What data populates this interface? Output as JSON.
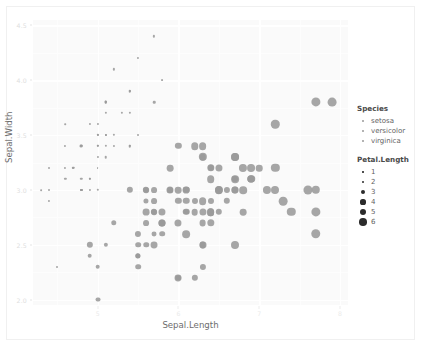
{
  "chart_data": {
    "type": "scatter",
    "title": "",
    "xlabel": "Sepal.Length",
    "ylabel": "Sepal.Width",
    "xlim": [
      4.2,
      8.1
    ],
    "ylim": [
      1.95,
      4.55
    ],
    "xticks": [
      5,
      6,
      7,
      8
    ],
    "yticks": [
      2.0,
      2.5,
      3.0,
      3.5,
      4.0,
      4.5
    ],
    "xtick_labels": [
      "5",
      "6",
      "7",
      "8"
    ],
    "ytick_labels": [
      "2.0",
      "2.5",
      "3.0",
      "3.5",
      "4.0",
      "4.5"
    ],
    "grid": true,
    "legend_position": "right",
    "size_variable": "Petal.Length",
    "color_variable": "Species",
    "point_color": "#9a9a9a",
    "panel_background": "#fafafa",
    "grid_color": "#ffffff",
    "series": [
      {
        "name": "setosa",
        "points": [
          [
            5.1,
            3.5,
            1.4
          ],
          [
            4.9,
            3.0,
            1.4
          ],
          [
            4.7,
            3.2,
            1.3
          ],
          [
            4.6,
            3.1,
            1.5
          ],
          [
            5.0,
            3.6,
            1.4
          ],
          [
            5.4,
            3.9,
            1.7
          ],
          [
            4.6,
            3.4,
            1.4
          ],
          [
            5.0,
            3.4,
            1.5
          ],
          [
            4.4,
            2.9,
            1.4
          ],
          [
            4.9,
            3.1,
            1.5
          ],
          [
            5.4,
            3.7,
            1.5
          ],
          [
            4.8,
            3.4,
            1.6
          ],
          [
            4.8,
            3.0,
            1.4
          ],
          [
            4.3,
            3.0,
            1.1
          ],
          [
            5.8,
            4.0,
            1.2
          ],
          [
            5.7,
            4.4,
            1.5
          ],
          [
            5.4,
            3.9,
            1.3
          ],
          [
            5.1,
            3.5,
            1.4
          ],
          [
            5.7,
            3.8,
            1.7
          ],
          [
            5.1,
            3.8,
            1.5
          ],
          [
            5.4,
            3.4,
            1.7
          ],
          [
            5.1,
            3.7,
            1.5
          ],
          [
            4.6,
            3.6,
            1.0
          ],
          [
            5.1,
            3.3,
            1.7
          ],
          [
            4.8,
            3.4,
            1.9
          ],
          [
            5.0,
            3.0,
            1.6
          ],
          [
            5.0,
            3.4,
            1.6
          ],
          [
            5.2,
            3.5,
            1.5
          ],
          [
            5.2,
            3.4,
            1.4
          ],
          [
            4.7,
            3.2,
            1.6
          ],
          [
            4.8,
            3.1,
            1.6
          ],
          [
            5.4,
            3.4,
            1.5
          ],
          [
            5.2,
            4.1,
            1.5
          ],
          [
            5.5,
            4.2,
            1.4
          ],
          [
            4.9,
            3.1,
            1.5
          ],
          [
            5.0,
            3.2,
            1.2
          ],
          [
            5.5,
            3.5,
            1.3
          ],
          [
            4.9,
            3.6,
            1.4
          ],
          [
            4.4,
            3.0,
            1.3
          ],
          [
            5.1,
            3.4,
            1.5
          ],
          [
            5.0,
            3.5,
            1.3
          ],
          [
            4.5,
            2.3,
            1.3
          ],
          [
            4.4,
            3.2,
            1.3
          ],
          [
            5.0,
            3.5,
            1.6
          ],
          [
            5.1,
            3.8,
            1.9
          ],
          [
            4.8,
            3.0,
            1.4
          ],
          [
            5.1,
            3.8,
            1.6
          ],
          [
            4.6,
            3.2,
            1.4
          ],
          [
            5.3,
            3.7,
            1.5
          ],
          [
            5.0,
            3.3,
            1.4
          ]
        ]
      },
      {
        "name": "versicolor",
        "points": [
          [
            7.0,
            3.2,
            4.7
          ],
          [
            6.4,
            3.2,
            4.5
          ],
          [
            6.9,
            3.1,
            4.9
          ],
          [
            5.5,
            2.3,
            4.0
          ],
          [
            6.5,
            2.8,
            4.6
          ],
          [
            5.7,
            2.8,
            4.5
          ],
          [
            6.3,
            3.3,
            4.7
          ],
          [
            4.9,
            2.4,
            3.3
          ],
          [
            6.6,
            2.9,
            4.6
          ],
          [
            5.2,
            2.7,
            3.9
          ],
          [
            5.0,
            2.0,
            3.5
          ],
          [
            5.9,
            3.0,
            4.2
          ],
          [
            6.0,
            2.2,
            4.0
          ],
          [
            6.1,
            2.9,
            4.7
          ],
          [
            5.6,
            2.9,
            3.6
          ],
          [
            6.7,
            3.1,
            4.4
          ],
          [
            5.6,
            3.0,
            4.5
          ],
          [
            5.8,
            2.7,
            4.1
          ],
          [
            6.2,
            2.2,
            4.5
          ],
          [
            5.6,
            2.5,
            3.9
          ],
          [
            5.9,
            3.2,
            4.8
          ],
          [
            6.1,
            2.8,
            4.0
          ],
          [
            6.3,
            2.5,
            4.9
          ],
          [
            6.1,
            2.8,
            4.7
          ],
          [
            6.4,
            2.9,
            4.3
          ],
          [
            6.6,
            3.0,
            4.4
          ],
          [
            6.8,
            2.8,
            4.8
          ],
          [
            6.7,
            3.0,
            5.0
          ],
          [
            6.0,
            2.9,
            4.5
          ],
          [
            5.7,
            2.6,
            3.5
          ],
          [
            5.5,
            2.4,
            3.8
          ],
          [
            5.5,
            2.4,
            3.7
          ],
          [
            5.8,
            2.7,
            3.9
          ],
          [
            6.0,
            2.7,
            5.1
          ],
          [
            5.4,
            3.0,
            4.5
          ],
          [
            6.0,
            3.4,
            4.5
          ],
          [
            6.7,
            3.1,
            4.7
          ],
          [
            6.3,
            2.3,
            4.4
          ],
          [
            5.6,
            3.0,
            4.1
          ],
          [
            5.5,
            2.5,
            4.0
          ],
          [
            5.5,
            2.6,
            4.4
          ],
          [
            6.1,
            3.0,
            4.6
          ],
          [
            5.8,
            2.6,
            4.0
          ],
          [
            5.0,
            2.3,
            3.3
          ],
          [
            5.6,
            2.7,
            4.2
          ],
          [
            5.7,
            3.0,
            4.2
          ],
          [
            5.7,
            2.9,
            4.2
          ],
          [
            6.2,
            2.9,
            4.3
          ],
          [
            5.1,
            2.5,
            3.0
          ],
          [
            5.7,
            2.8,
            4.1
          ]
        ]
      },
      {
        "name": "virginica",
        "points": [
          [
            6.3,
            3.3,
            6.0
          ],
          [
            5.8,
            2.7,
            5.1
          ],
          [
            7.1,
            3.0,
            5.9
          ],
          [
            6.3,
            2.9,
            5.6
          ],
          [
            6.5,
            3.0,
            5.8
          ],
          [
            7.6,
            3.0,
            6.6
          ],
          [
            4.9,
            2.5,
            4.5
          ],
          [
            7.3,
            2.9,
            6.3
          ],
          [
            6.7,
            2.5,
            5.8
          ],
          [
            7.2,
            3.6,
            6.1
          ],
          [
            6.5,
            3.2,
            5.1
          ],
          [
            6.4,
            2.7,
            5.3
          ],
          [
            6.8,
            3.0,
            5.5
          ],
          [
            5.7,
            2.5,
            5.0
          ],
          [
            5.8,
            2.8,
            5.1
          ],
          [
            6.4,
            3.2,
            5.3
          ],
          [
            6.5,
            3.0,
            5.5
          ],
          [
            7.7,
            3.8,
            6.7
          ],
          [
            7.7,
            2.6,
            6.9
          ],
          [
            6.0,
            2.2,
            5.0
          ],
          [
            6.9,
            3.2,
            5.7
          ],
          [
            5.6,
            2.8,
            4.9
          ],
          [
            7.7,
            2.8,
            6.7
          ],
          [
            6.3,
            2.7,
            4.9
          ],
          [
            6.7,
            3.3,
            5.7
          ],
          [
            7.2,
            3.2,
            6.0
          ],
          [
            6.2,
            2.8,
            4.8
          ],
          [
            6.1,
            3.0,
            4.9
          ],
          [
            6.4,
            2.8,
            5.6
          ],
          [
            7.2,
            3.0,
            5.8
          ],
          [
            7.4,
            2.8,
            6.1
          ],
          [
            7.9,
            3.8,
            6.4
          ],
          [
            6.4,
            2.8,
            5.6
          ],
          [
            6.3,
            2.8,
            5.1
          ],
          [
            6.1,
            2.6,
            5.6
          ],
          [
            7.7,
            3.0,
            6.1
          ],
          [
            6.3,
            3.4,
            5.6
          ],
          [
            6.4,
            3.1,
            5.5
          ],
          [
            6.0,
            3.0,
            4.8
          ],
          [
            6.9,
            3.1,
            5.4
          ],
          [
            6.7,
            3.1,
            5.6
          ],
          [
            6.9,
            3.1,
            5.1
          ],
          [
            5.8,
            2.7,
            5.1
          ],
          [
            6.8,
            3.2,
            5.9
          ],
          [
            6.7,
            3.3,
            5.7
          ],
          [
            6.7,
            3.0,
            5.2
          ],
          [
            6.3,
            2.5,
            5.0
          ],
          [
            6.5,
            3.0,
            5.2
          ],
          [
            6.2,
            3.4,
            5.4
          ],
          [
            5.9,
            3.0,
            5.1
          ]
        ]
      }
    ]
  },
  "legends": {
    "species": {
      "title": "Species",
      "items": [
        {
          "label": "setosa"
        },
        {
          "label": "versicolor"
        },
        {
          "label": "virginica"
        }
      ]
    },
    "petal_length": {
      "title": "Petal.Length",
      "items": [
        {
          "label": "1",
          "size": 1
        },
        {
          "label": "2",
          "size": 2
        },
        {
          "label": "3",
          "size": 3
        },
        {
          "label": "4",
          "size": 4
        },
        {
          "label": "5",
          "size": 5
        },
        {
          "label": "6",
          "size": 6
        }
      ]
    }
  }
}
